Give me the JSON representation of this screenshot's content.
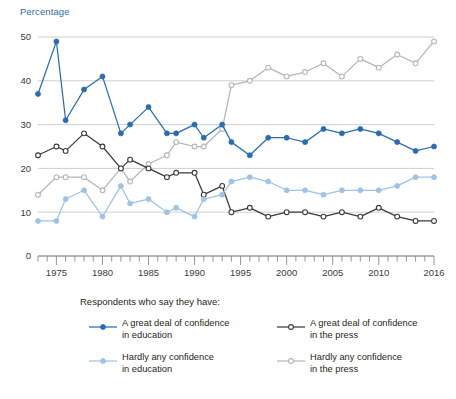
{
  "axis_title": "Percentage",
  "legend": {
    "caption": "Respondents who say they have:",
    "items": [
      {
        "key": "edu_great",
        "label": "A great deal of confidence\nin education",
        "color": "#2b6cb0",
        "filled": true
      },
      {
        "key": "edu_hardly",
        "label": "Hardly any confidence\nin education",
        "color": "#9dc3e6",
        "filled": true
      },
      {
        "key": "prs_great",
        "label": "A great deal of confidence\nin the press",
        "color": "#3a3a3a",
        "filled": false
      },
      {
        "key": "prs_hardly",
        "label": "Hardly any confidence\nin the press",
        "color": "#b5b5b5",
        "filled": false
      }
    ]
  },
  "chart_data": {
    "type": "line",
    "title": "",
    "xlabel": "",
    "ylabel": "Percentage",
    "xlim": [
      1973,
      2016
    ],
    "ylim": [
      0,
      52
    ],
    "yticks": [
      0,
      10,
      20,
      30,
      40,
      50
    ],
    "xticks_labeled": [
      1975,
      1980,
      1985,
      1990,
      1995,
      2000,
      2005,
      2010,
      2016
    ],
    "xtick_step": 1,
    "grid": "horizontal",
    "legend_position": "below",
    "x": [
      1973,
      1974,
      1975,
      1976,
      1977,
      1978,
      1980,
      1982,
      1983,
      1984,
      1985,
      1986,
      1987,
      1988,
      1989,
      1990,
      1991,
      1993,
      1994,
      1996,
      1998,
      2000,
      2002,
      2004,
      2006,
      2008,
      2010,
      2012,
      2014,
      2016
    ],
    "series": [
      {
        "name": "A great deal of confidence in education",
        "key": "edu_great",
        "color": "#2b6cb0",
        "marker": "filled-circle",
        "values": [
          37,
          null,
          49,
          31,
          null,
          38,
          41,
          28,
          30,
          null,
          34,
          null,
          28,
          28,
          null,
          30,
          27,
          30,
          26,
          23,
          27,
          27,
          26,
          29,
          28,
          29,
          28,
          26,
          24,
          25
        ]
      },
      {
        "name": "A great deal of confidence in the press",
        "key": "prs_great",
        "color": "#3a3a3a",
        "marker": "open-circle",
        "values": [
          23,
          null,
          25,
          24,
          null,
          28,
          25,
          20,
          22,
          null,
          20,
          null,
          18,
          19,
          null,
          19,
          14,
          16,
          10,
          11,
          9,
          10,
          10,
          9,
          10,
          9,
          11,
          9,
          8,
          8
        ]
      },
      {
        "name": "Hardly any confidence in the press",
        "key": "prs_hardly",
        "color": "#b5b5b5",
        "marker": "open-circle",
        "values": [
          14,
          null,
          18,
          18,
          null,
          18,
          15,
          20,
          17,
          null,
          21,
          null,
          23,
          26,
          null,
          25,
          25,
          29,
          39,
          40,
          43,
          41,
          42,
          44,
          41,
          45,
          43,
          46,
          44,
          49
        ]
      },
      {
        "name": "Hardly any confidence in education",
        "key": "edu_hardly",
        "color": "#9dc3e6",
        "marker": "filled-circle",
        "values": [
          8,
          null,
          8,
          13,
          null,
          15,
          9,
          16,
          12,
          null,
          13,
          null,
          10,
          11,
          null,
          9,
          13,
          14,
          17,
          18,
          17,
          15,
          15,
          14,
          15,
          15,
          15,
          16,
          18,
          18
        ]
      }
    ]
  }
}
